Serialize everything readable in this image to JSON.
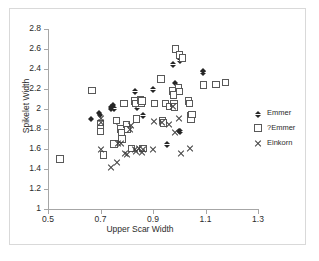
{
  "chart_data": {
    "type": "scatter",
    "title": "",
    "xlabel": "Upper Scar Width",
    "ylabel": "Spikelet Width",
    "xlim": [
      0.5,
      1.3
    ],
    "ylim": [
      1,
      2.8
    ],
    "xticks": [
      "0.5",
      "0.7",
      "0.9",
      "1.1",
      "1.3"
    ],
    "xtick_values": [
      0.5,
      0.7,
      0.9,
      1.1,
      1.3
    ],
    "yticks": [
      "1",
      "1.2",
      "1.4",
      "1.6",
      "1.8",
      "2",
      "2.2",
      "2.4",
      "2.6",
      "2.8"
    ],
    "ytick_values": [
      1,
      1.2,
      1.4,
      1.6,
      1.8,
      2,
      2.2,
      2.4,
      2.6,
      2.8
    ],
    "grid": false,
    "legend_position": "right",
    "series": [
      {
        "name": "Emmer",
        "marker": "filled-diamond",
        "color": "#262626",
        "points": [
          [
            0.665,
            1.915
          ],
          [
            0.695,
            1.975
          ],
          [
            0.7,
            1.955
          ],
          [
            0.74,
            2.035
          ],
          [
            0.742,
            2.015
          ],
          [
            0.748,
            2.055
          ],
          [
            0.752,
            2.02
          ],
          [
            0.762,
            1.89
          ],
          [
            0.833,
            2.19
          ],
          [
            0.835,
            2.06
          ],
          [
            0.838,
            2.03
          ],
          [
            0.862,
            1.95
          ],
          [
            0.9,
            2.21
          ],
          [
            0.955,
            1.66
          ],
          [
            0.975,
            2.46
          ],
          [
            0.985,
            2.275
          ],
          [
            0.998,
            1.795
          ],
          [
            1.002,
            1.79
          ],
          [
            1.005,
            2.5
          ],
          [
            1.09,
            2.395
          ],
          [
            1.092,
            2.38
          ]
        ]
      },
      {
        "name": "?Emmer",
        "marker": "open-square",
        "color": "#595959",
        "points": [
          [
            0.545,
            1.5
          ],
          [
            0.668,
            2.185
          ],
          [
            0.7,
            1.855
          ],
          [
            0.7,
            1.8
          ],
          [
            0.7,
            1.775
          ],
          [
            0.712,
            1.54
          ],
          [
            0.752,
            1.65
          ],
          [
            0.762,
            1.885
          ],
          [
            0.778,
            1.8
          ],
          [
            0.78,
            1.76
          ],
          [
            0.782,
            1.7
          ],
          [
            0.79,
            2.055
          ],
          [
            0.8,
            1.845
          ],
          [
            0.802,
            1.795
          ],
          [
            0.818,
            1.605
          ],
          [
            0.832,
            2.08
          ],
          [
            0.835,
            2.055
          ],
          [
            0.838,
            1.9
          ],
          [
            0.852,
            2.09
          ],
          [
            0.855,
            2.06
          ],
          [
            0.858,
            2.08
          ],
          [
            0.862,
            1.605
          ],
          [
            0.905,
            2.055
          ],
          [
            0.93,
            2.3
          ],
          [
            0.935,
            1.885
          ],
          [
            0.94,
            1.86
          ],
          [
            0.948,
            2.055
          ],
          [
            0.965,
            2.025
          ],
          [
            0.975,
            2.18
          ],
          [
            0.978,
            2.14
          ],
          [
            0.98,
            2.055
          ],
          [
            0.982,
            2.02
          ],
          [
            0.985,
            2.6
          ],
          [
            0.998,
            2.215
          ],
          [
            1.0,
            2.175
          ],
          [
            1.002,
            2.54
          ],
          [
            1.012,
            2.51
          ],
          [
            1.035,
            2.08
          ],
          [
            1.04,
            2.055
          ],
          [
            1.042,
            1.935
          ],
          [
            1.045,
            1.895
          ],
          [
            1.048,
            1.945
          ],
          [
            1.092,
            2.24
          ],
          [
            1.14,
            2.245
          ],
          [
            1.175,
            2.265
          ]
        ]
      },
      {
        "name": "Einkorn",
        "marker": "x-cross",
        "color": "#404040",
        "points": [
          [
            0.7,
            1.905
          ],
          [
            0.7,
            1.87
          ],
          [
            0.702,
            1.6
          ],
          [
            0.74,
            1.415
          ],
          [
            0.762,
            1.465
          ],
          [
            0.765,
            1.655
          ],
          [
            0.778,
            1.66
          ],
          [
            0.795,
            1.56
          ],
          [
            0.8,
            1.545
          ],
          [
            0.812,
            1.795
          ],
          [
            0.815,
            1.835
          ],
          [
            0.832,
            1.6
          ],
          [
            0.835,
            1.575
          ],
          [
            0.848,
            1.605
          ],
          [
            0.858,
            1.57
          ],
          [
            0.862,
            1.6
          ],
          [
            0.9,
            1.6
          ],
          [
            0.905,
            1.88
          ],
          [
            0.935,
            1.87
          ],
          [
            0.96,
            1.845
          ],
          [
            0.978,
            2.03
          ],
          [
            0.985,
            1.77
          ],
          [
            1.0,
            1.905
          ],
          [
            1.005,
            1.56
          ],
          [
            1.04,
            1.605
          ]
        ]
      }
    ]
  },
  "legend": {
    "items": [
      {
        "label": "Emmer",
        "marker": "filled-diamond"
      },
      {
        "label": "?Emmer",
        "marker": "open-square"
      },
      {
        "label": "Einkorn",
        "marker": "x-cross"
      }
    ]
  }
}
